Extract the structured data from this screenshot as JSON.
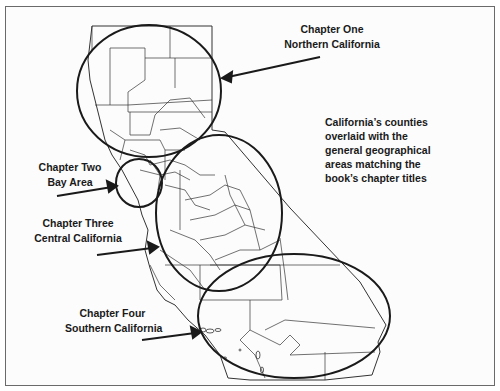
{
  "labels": {
    "chapter_one": {
      "line1": "Chapter One",
      "line2": "Northern California"
    },
    "chapter_two": {
      "line1": "Chapter Two",
      "line2": "Bay Area"
    },
    "chapter_three": {
      "line1": "Chapter Three",
      "line2": "Central California"
    },
    "chapter_four": {
      "line1": "Chapter Four",
      "line2": "Southern California"
    }
  },
  "caption": {
    "lines": [
      "California’s counties",
      "overlaid with the",
      "general geographical",
      "areas matching the",
      "book’s chapter titles"
    ]
  },
  "colors": {
    "outline": "#1a1a1a",
    "county_lines": "#333333",
    "frame": "#6a6a6a",
    "background": "#fcfcfc"
  }
}
